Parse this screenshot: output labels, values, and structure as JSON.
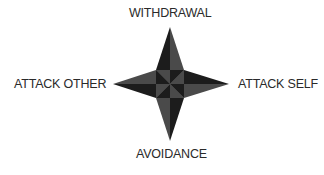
{
  "diagram": {
    "type": "four-point-star-compass",
    "labels": {
      "top": "WITHDRAWAL",
      "left": "ATTACK OTHER",
      "right": "ATTACK SELF",
      "bottom": "AVOIDANCE"
    },
    "colors": {
      "dark": "#1c1c1c",
      "light": "#4a4a4a",
      "text": "#2a2a2a"
    }
  }
}
